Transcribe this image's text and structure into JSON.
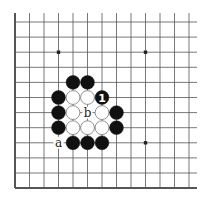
{
  "diagram": {
    "type": "go-board-fragment",
    "grid": {
      "x0": 15,
      "y0": 22,
      "dx": 14.5,
      "dy": 15.1,
      "cols": 13,
      "rows": 12
    },
    "star_points": [
      [
        3,
        2
      ],
      [
        9,
        2
      ],
      [
        9,
        8
      ]
    ],
    "stones": [
      {
        "color": "black",
        "col": 4,
        "row": 4
      },
      {
        "color": "black",
        "col": 5,
        "row": 4
      },
      {
        "color": "black",
        "col": 3,
        "row": 5
      },
      {
        "color": "white",
        "col": 4,
        "row": 5
      },
      {
        "color": "white",
        "col": 5,
        "row": 5
      },
      {
        "color": "black",
        "col": 6,
        "row": 5,
        "label": "1"
      },
      {
        "color": "black",
        "col": 3,
        "row": 6
      },
      {
        "color": "white",
        "col": 4,
        "row": 6
      },
      {
        "color": "white",
        "col": 6,
        "row": 6
      },
      {
        "color": "black",
        "col": 7,
        "row": 6
      },
      {
        "color": "black",
        "col": 3,
        "row": 7
      },
      {
        "color": "white",
        "col": 4,
        "row": 7
      },
      {
        "color": "white",
        "col": 5,
        "row": 7
      },
      {
        "color": "white",
        "col": 6,
        "row": 7
      },
      {
        "color": "black",
        "col": 7,
        "row": 7
      },
      {
        "color": "black",
        "col": 4,
        "row": 8
      },
      {
        "color": "black",
        "col": 5,
        "row": 8
      },
      {
        "color": "black",
        "col": 6,
        "row": 8
      }
    ],
    "labels": [
      {
        "text": "a",
        "col": 3,
        "row": 8
      },
      {
        "text": "b",
        "col": 5,
        "row": 6
      }
    ]
  }
}
